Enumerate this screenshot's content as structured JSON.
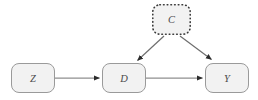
{
  "diagram": {
    "type": "causal-dag",
    "background_color": "#ffffff",
    "node_fill_color": "#f2f2f2",
    "node_stroke_color": "#9a9a9a",
    "dotted_node_stroke_color": "#3a3a3a",
    "edge_color": "#8f8f8f",
    "arrowhead_color": "#2b2b2b",
    "label_color": "#4a4a4a",
    "nodes": [
      {
        "id": "Z",
        "label": "Z",
        "border_style": "solid",
        "x": 11,
        "y": 63,
        "width": 43,
        "height": 29
      },
      {
        "id": "D",
        "label": "D",
        "border_style": "solid",
        "x": 102,
        "y": 63,
        "width": 43,
        "height": 29
      },
      {
        "id": "Y",
        "label": "Y",
        "border_style": "solid",
        "x": 205,
        "y": 63,
        "width": 43,
        "height": 29
      },
      {
        "id": "C",
        "label": "C",
        "border_style": "dotted",
        "x": 152,
        "y": 4,
        "width": 38,
        "height": 30
      }
    ],
    "edges": [
      {
        "id": "Z-D",
        "from": "Z",
        "to": "D",
        "style": "solid",
        "arrow": "single"
      },
      {
        "id": "D-Y",
        "from": "D",
        "to": "Y",
        "style": "solid",
        "arrow": "single"
      },
      {
        "id": "C-D",
        "from": "C",
        "to": "D",
        "style": "solid",
        "arrow": "single"
      },
      {
        "id": "C-Y",
        "from": "C",
        "to": "Y",
        "style": "solid",
        "arrow": "single"
      }
    ]
  }
}
